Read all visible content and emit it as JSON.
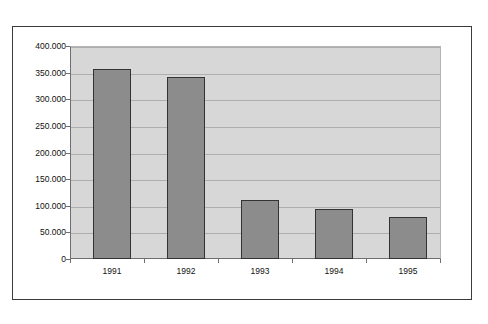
{
  "chart_data": {
    "type": "bar",
    "title": "",
    "subtitle": "",
    "xlabel": "",
    "ylabel": "",
    "categories": [
      "1991",
      "1992",
      "1993",
      "1994",
      "1995"
    ],
    "values": [
      357000,
      341000,
      110000,
      94000,
      79000
    ],
    "series": [
      {
        "name": "",
        "values": [
          357000,
          341000,
          110000,
          94000,
          79000
        ]
      }
    ],
    "ylim": [
      0,
      400000
    ],
    "ytick_values": [
      0,
      50000,
      100000,
      150000,
      200000,
      250000,
      300000,
      350000,
      400000
    ],
    "ytick_labels": [
      "0",
      "50.000",
      "100.000",
      "150.000",
      "200.000",
      "250.000",
      "300.000",
      "350.000",
      "400.000"
    ],
    "grid": true,
    "legend": false,
    "legend_position": "none",
    "annotations": [],
    "colors": {
      "bar_fill": "#8c8c8c",
      "bar_border": "#333333",
      "plot_background": "#d7d7d7",
      "gridline": "#aeaeae",
      "axis_line": "#6e6e6e",
      "frame_border": "#3b3b3b",
      "page_background": "#ffffff",
      "text": "#111111"
    }
  }
}
